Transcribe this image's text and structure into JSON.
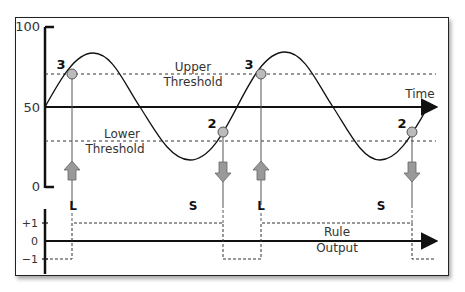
{
  "diagram": {
    "y_axis_labels": {
      "top": "100",
      "mid": "50",
      "bottom": "0"
    },
    "x_axis_label": "Time",
    "upper_threshold_label": [
      "Upper",
      "Threshold"
    ],
    "lower_threshold_label": [
      "Lower",
      "Threshold"
    ],
    "points": [
      {
        "label": "3",
        "signal": "L"
      },
      {
        "label": "2",
        "signal": "S"
      },
      {
        "label": "3",
        "signal": "L"
      },
      {
        "label": "2",
        "signal": "S"
      }
    ],
    "output_axis_labels": {
      "plus": "+1",
      "zero": "0",
      "minus": "−1"
    },
    "output_label": [
      "Rule",
      "Output"
    ],
    "colors": {
      "line": "#111111",
      "marker": "#bbbbbb",
      "arrow": "#999999",
      "dashed": "#333333"
    }
  }
}
